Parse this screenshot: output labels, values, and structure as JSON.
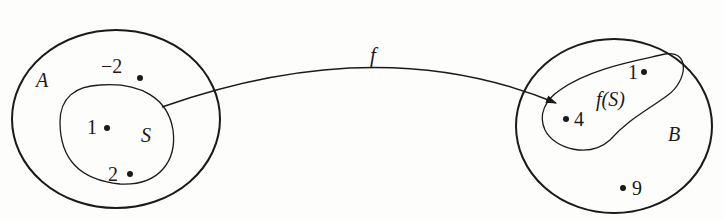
{
  "diagram": {
    "type": "function-mapping",
    "domain_set": {
      "label": "A",
      "subset": {
        "label": "S",
        "elements": [
          "1",
          "2"
        ]
      },
      "other_elements": [
        "−2"
      ]
    },
    "codomain_set": {
      "label": "B",
      "image_subset": {
        "label": "f(S)",
        "elements": [
          "1",
          "4"
        ]
      },
      "other_elements": [
        "9"
      ]
    },
    "arrow": {
      "label": "f",
      "from": "S",
      "to": "f(S)"
    },
    "colors": {
      "ink": "#1a1a1a",
      "background": "#fdfdfc"
    }
  }
}
